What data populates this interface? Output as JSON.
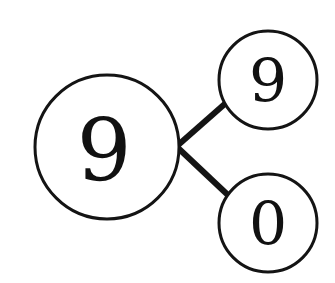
{
  "figure": {
    "type": "number-bond",
    "background_color": "#ffffff",
    "stroke_color": "#141414",
    "text_color": "#111111"
  },
  "whole": {
    "value": "9",
    "role": "whole",
    "center_x": 107,
    "center_y": 147,
    "radius": 72,
    "stroke_width": 3
  },
  "parts": [
    {
      "value": "9",
      "role": "part-top",
      "center_x": 268,
      "center_y": 80,
      "radius": 49,
      "stroke_width": 3
    },
    {
      "value": "0",
      "role": "part-bottom",
      "center_x": 268,
      "center_y": 223,
      "radius": 49,
      "stroke_width": 3
    }
  ],
  "connectors": [
    {
      "name": "whole-to-top-part",
      "x1": 177,
      "y1": 146,
      "x2": 227,
      "y2": 102,
      "width": 6
    },
    {
      "name": "whole-to-bottom-part",
      "x1": 177,
      "y1": 147,
      "x2": 229,
      "y2": 196,
      "width": 6
    }
  ]
}
